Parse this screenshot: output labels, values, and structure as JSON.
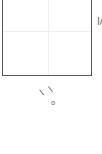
{
  "chart_data": {
    "type": "scatter",
    "title": "",
    "xlabel": "",
    "ylabel": "",
    "series": [],
    "grid": true,
    "note": "cropped fragment of a plot panel; only frame, gridlines and partial label glyphs visible",
    "partial_labels": {
      "right_edge": "|/",
      "bottom_fragment": "\\ \\",
      "bottom_small": "o"
    }
  },
  "colors": {
    "frame": "#555555",
    "grid": "#eeeeee",
    "background": "#ffffff"
  }
}
